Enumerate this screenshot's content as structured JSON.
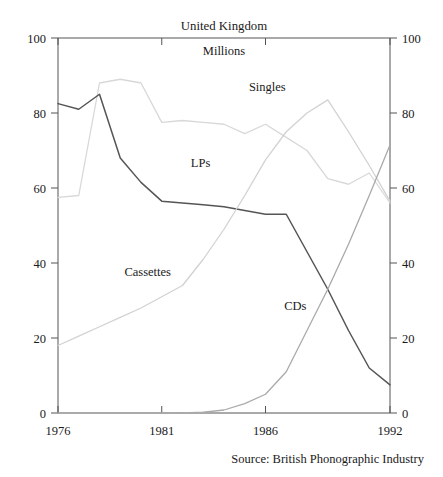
{
  "chart_data": {
    "type": "line",
    "title": "United Kingdom",
    "subtitle": "Millions",
    "source": "Source: British Phonographic Industry",
    "xlabel": "",
    "ylabel": "",
    "xlim": [
      1976,
      1992
    ],
    "ylim": [
      0,
      100
    ],
    "grid": false,
    "legend_position": "inline-labels",
    "x_ticks": [
      "1976",
      "1981",
      "1986",
      "1992"
    ],
    "x_tick_values": [
      1976,
      1981,
      1986,
      1992
    ],
    "y_ticks_left": [
      "0",
      "20",
      "40",
      "60",
      "80",
      "100"
    ],
    "y_ticks_right": [
      "0",
      "20",
      "40",
      "60",
      "80",
      "100"
    ],
    "y_tick_values": [
      0,
      20,
      40,
      60,
      80,
      100
    ],
    "x": [
      1976,
      1977,
      1978,
      1979,
      1980,
      1981,
      1982,
      1983,
      1984,
      1985,
      1986,
      1987,
      1988,
      1989,
      1990,
      1991,
      1992
    ],
    "series": [
      {
        "name": "Singles",
        "color": "#d8d8d8",
        "label_x": 1985.2,
        "label_y": 86,
        "values": [
          57.5,
          58.0,
          88.0,
          89.0,
          88.0,
          77.5,
          78.0,
          77.5,
          77.0,
          74.5,
          77.0,
          73.5,
          70.0,
          62.5,
          61.0,
          64.0,
          56.0
        ]
      },
      {
        "name": "LPs",
        "color": "#555555",
        "label_x": 1982.4,
        "label_y": 65.5,
        "values": [
          82.5,
          81.0,
          85.0,
          68.0,
          61.5,
          56.5,
          56.0,
          55.5,
          55.0,
          54.0,
          53.0,
          53.0,
          43.0,
          33.0,
          22.0,
          12.0,
          7.5
        ]
      },
      {
        "name": "Cassettes",
        "color": "#d2d2d2",
        "label_x": 1979.2,
        "label_y": 36.5,
        "values": [
          18.0,
          20.5,
          23.0,
          25.5,
          28.0,
          31.0,
          34.0,
          41.0,
          49.0,
          58.0,
          67.5,
          75.0,
          80.0,
          83.5,
          75.0,
          66.0,
          56.5
        ]
      },
      {
        "name": "CDs",
        "color": "#aaaaaa",
        "label_x": 1986.9,
        "label_y": 27.5,
        "values": [
          0,
          0,
          0,
          0,
          0,
          0,
          0,
          0.2,
          0.8,
          2.5,
          5.0,
          11.0,
          22.0,
          33.0,
          45.0,
          58.0,
          71.5
        ]
      }
    ]
  }
}
